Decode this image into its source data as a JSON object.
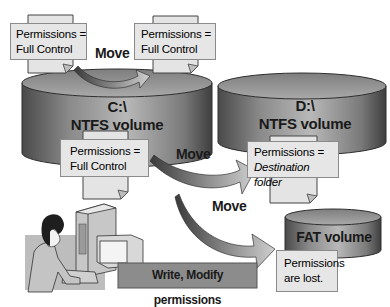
{
  "diagram": {
    "volumes": [
      {
        "id": "c",
        "line1": "C:\\",
        "line2": "NTFS volume",
        "fs": "NTFS"
      },
      {
        "id": "d",
        "line1": "D:\\",
        "line2": "NTFS volume",
        "fs": "NTFS"
      },
      {
        "id": "fat",
        "line1": "FAT volume",
        "fs": "FAT"
      }
    ],
    "notes": {
      "c_source": {
        "line1": "Permissions =",
        "line2": "Full Control"
      },
      "c_dest": {
        "line1": "Permissions =",
        "line2": "Full Control"
      },
      "c_bottom": {
        "line1": "Permissions =",
        "line2": "Full Control"
      },
      "d_dest": {
        "line1": "Permissions =",
        "line2": "Destination folder"
      },
      "fat_dest": {
        "line1": "Permissions",
        "line2": "are lost."
      }
    },
    "arrows": [
      {
        "label": "Move",
        "from": "C:\\ folder",
        "to": "C:\\ folder (same volume)"
      },
      {
        "label": "Move",
        "from": "C:\\ folder",
        "to": "D:\\ NTFS volume"
      },
      {
        "label": "Move",
        "from": "C:\\ folder",
        "to": "FAT volume"
      }
    ],
    "user_caption": "Write, Modify permissions",
    "colors": {
      "note_fill": "#e6e6e6",
      "note_border": "#8a8a8a",
      "cylinder_dark": "#5a5a5a",
      "cylinder_light": "#b5b5b5",
      "caption_fill": "#8c8c8c"
    }
  }
}
